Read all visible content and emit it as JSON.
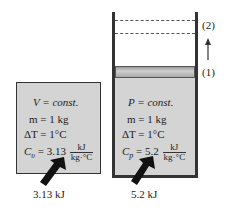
{
  "left_box": {
    "lines": [
      "V = const.",
      "m = 1 kg",
      "ΔT = 1°C"
    ],
    "cap_label": "C",
    "cap_sub": "υ",
    "cap_value": "= 3.13",
    "unit_num": "kJ",
    "unit_den": "kg·°C",
    "heat_label": "3.13 kJ"
  },
  "right_box": {
    "lines": [
      "P = const.",
      "m = 1 kg",
      "ΔT = 1°C"
    ],
    "cap_label": "C",
    "cap_sub": "p",
    "cap_value": "= 5.2",
    "unit_num": "kJ",
    "unit_den": "kg·°C",
    "heat_label": "5.2 kJ",
    "state_1": "(1)",
    "state_2": "(2)"
  },
  "colors": {
    "fill": "#d4d4d4",
    "stroke": "#333333"
  }
}
